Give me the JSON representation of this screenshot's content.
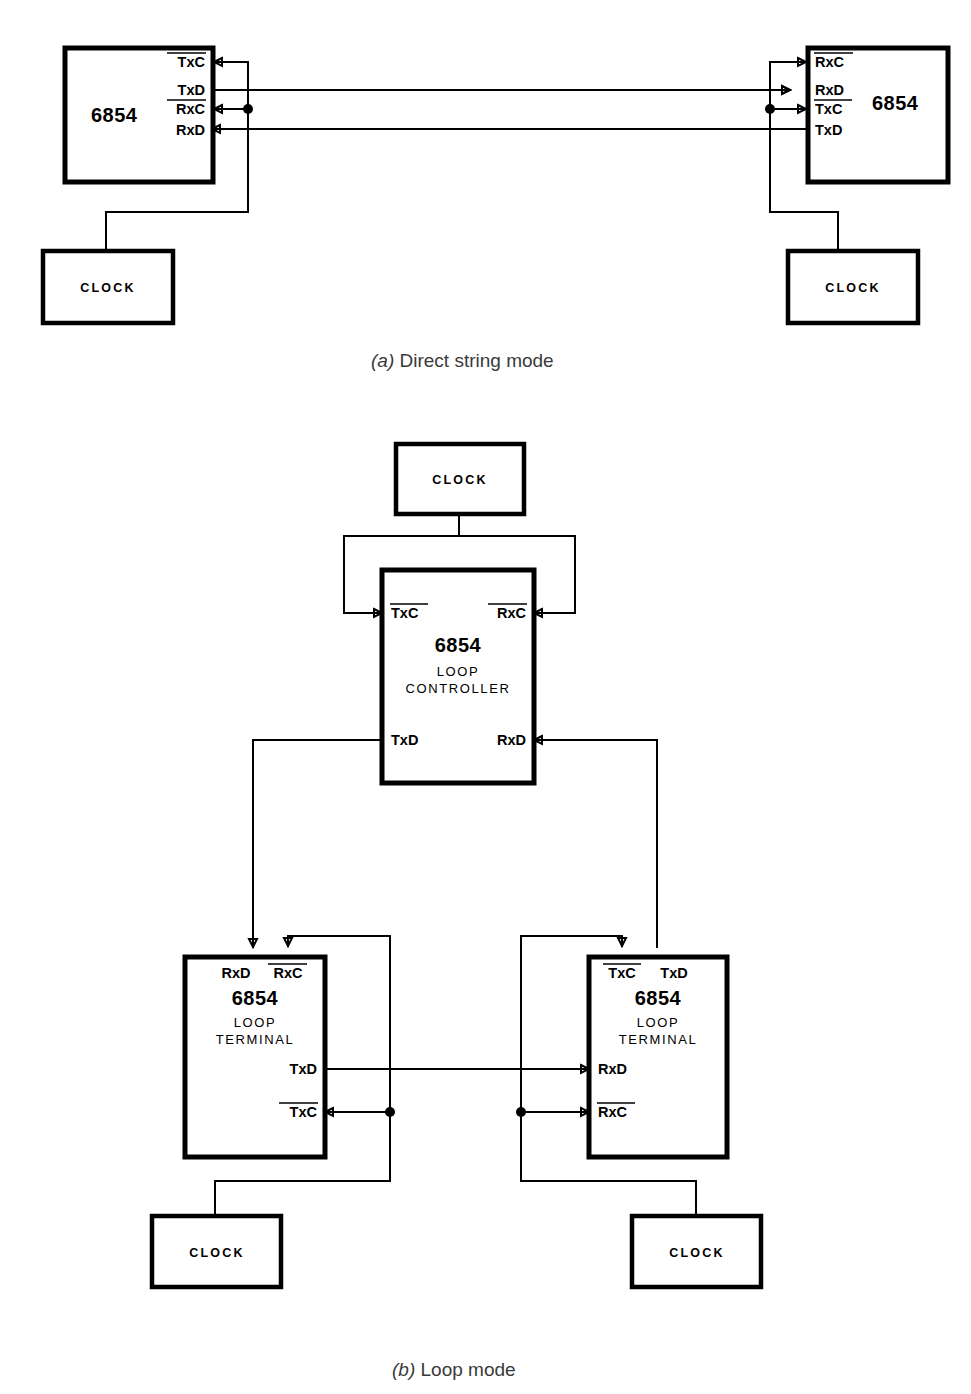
{
  "figure": {
    "panels": [
      {
        "id": "a",
        "caption_index": "(a)",
        "caption_text": " Direct string mode",
        "chips": [
          {
            "name": "left-adlc",
            "title": "6854",
            "subtitle": "",
            "pins": [
              {
                "label": "TxC",
                "overbar": true,
                "side": "right",
                "dir": "in"
              },
              {
                "label": "TxD",
                "overbar": false,
                "side": "right",
                "dir": "out"
              },
              {
                "label": "RxC",
                "overbar": true,
                "side": "right",
                "dir": "in"
              },
              {
                "label": "RxD",
                "overbar": false,
                "side": "right",
                "dir": "in"
              }
            ]
          },
          {
            "name": "right-adlc",
            "title": "6854",
            "subtitle": "",
            "pins": [
              {
                "label": "RxC",
                "overbar": true,
                "side": "left",
                "dir": "in"
              },
              {
                "label": "RxD",
                "overbar": false,
                "side": "left",
                "dir": "in"
              },
              {
                "label": "TxC",
                "overbar": true,
                "side": "left",
                "dir": "in"
              },
              {
                "label": "TxD",
                "overbar": false,
                "side": "left",
                "dir": "out"
              }
            ]
          }
        ],
        "clocks": [
          {
            "name": "left-clock",
            "label": "CLOCK"
          },
          {
            "name": "right-clock",
            "label": "CLOCK"
          }
        ]
      },
      {
        "id": "b",
        "caption_index": "(b)",
        "caption_text": " Loop mode",
        "chips": [
          {
            "name": "loop-controller",
            "title": "6854",
            "subtitle_line1": "LOOP",
            "subtitle_line2": "CONTROLLER",
            "pins": [
              {
                "label": "TxC",
                "overbar": true,
                "side": "left-top",
                "dir": "in"
              },
              {
                "label": "RxC",
                "overbar": true,
                "side": "right-top",
                "dir": "in"
              },
              {
                "label": "TxD",
                "overbar": false,
                "side": "left-bot",
                "dir": "out"
              },
              {
                "label": "RxD",
                "overbar": false,
                "side": "right-bot",
                "dir": "in"
              }
            ]
          },
          {
            "name": "left-loop-terminal",
            "title": "6854",
            "subtitle_line1": "LOOP",
            "subtitle_line2": "TERMINAL",
            "pins": [
              {
                "label": "RxD",
                "overbar": false,
                "side": "top",
                "dir": "in"
              },
              {
                "label": "RxC",
                "overbar": true,
                "side": "top",
                "dir": "in"
              },
              {
                "label": "TxD",
                "overbar": false,
                "side": "right",
                "dir": "out"
              },
              {
                "label": "TxC",
                "overbar": true,
                "side": "right",
                "dir": "in"
              }
            ]
          },
          {
            "name": "right-loop-terminal",
            "title": "6854",
            "subtitle_line1": "LOOP",
            "subtitle_line2": "TERMINAL",
            "pins": [
              {
                "label": "TxC",
                "overbar": true,
                "side": "top",
                "dir": "in"
              },
              {
                "label": "TxD",
                "overbar": false,
                "side": "top",
                "dir": "out"
              },
              {
                "label": "RxD",
                "overbar": false,
                "side": "left",
                "dir": "in"
              },
              {
                "label": "RxC",
                "overbar": true,
                "side": "left",
                "dir": "in"
              }
            ]
          }
        ],
        "clocks": [
          {
            "name": "controller-clock",
            "label": "CLOCK"
          },
          {
            "name": "left-terminal-clock",
            "label": "CLOCK"
          },
          {
            "name": "right-terminal-clock",
            "label": "CLOCK"
          }
        ]
      }
    ],
    "colors": {
      "line": "#000000",
      "background": "#ffffff",
      "caption": "#3a3a3a"
    }
  }
}
